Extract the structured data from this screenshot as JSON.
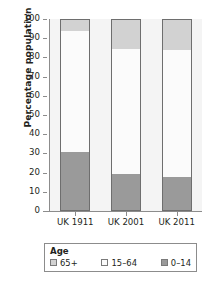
{
  "chart_data": {
    "type": "bar",
    "subtype": "100% stacked column",
    "title": "",
    "xlabel": "",
    "ylabel": "Percentage population",
    "categories": [
      "UK 1911",
      "UK 2001",
      "UK 2011"
    ],
    "series": [
      {
        "name": "65+",
        "color": "#d2d2d2",
        "values": [
          5.7,
          15.4,
          16.0
        ]
      },
      {
        "name": "15–64",
        "color": "#fbfbfb",
        "values": [
          63.6,
          65.8,
          66.8
        ]
      },
      {
        "name": "0–14",
        "color": "#9a9a9a",
        "values": [
          30.7,
          18.8,
          17.2
        ]
      }
    ],
    "ylim": [
      0,
      100
    ],
    "yticks": [
      100,
      90,
      80,
      70,
      60,
      50,
      40,
      30,
      20,
      10,
      0
    ],
    "ytick_labels": [
      "100",
      "90",
      "80",
      "70",
      "60",
      "50",
      "40",
      "30",
      "20",
      "10",
      "0"
    ],
    "grid": false,
    "legend_position": "bottom",
    "legend_title": "Age",
    "legend_entries": [
      "65+",
      "15–64",
      "0–14"
    ]
  },
  "axis": {
    "y_title": "Percentage population"
  },
  "legend": {
    "title": "Age",
    "items": [
      {
        "label": "65+",
        "color": "#d2d2d2"
      },
      {
        "label": "15–64",
        "color": "#fbfbfb"
      },
      {
        "label": "0–14",
        "color": "#9a9a9a"
      }
    ]
  },
  "colors": {
    "segment_65_plus": "#d2d2d2",
    "segment_15_64": "#fbfbfb",
    "segment_0_14": "#9a9a9a",
    "axis": "#8c8c8c",
    "bar_outline": "#6e6e6e",
    "plot_background": "#f4f4f4",
    "text": "#231f20"
  }
}
